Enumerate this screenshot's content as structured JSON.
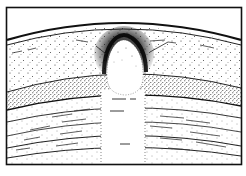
{
  "diagram": {
    "type": "geological-cross-section",
    "labels": [],
    "colors": {
      "background": "#ffffff",
      "ink": "#1a1a1a",
      "stipple": "#2a2a2a",
      "halo": "#111111"
    },
    "frame": {
      "x": 6,
      "y": 7,
      "width": 236,
      "height": 158
    },
    "layers": [
      {
        "name": "top-crust-band",
        "pattern": "solid-double-line"
      },
      {
        "name": "upper-sparse-stipple-layer",
        "pattern": "sparse-dots-with-dashes"
      },
      {
        "name": "dense-stipple-layer",
        "pattern": "dense-dots"
      },
      {
        "name": "lower-striated-layers",
        "pattern": "dots-with-horizontal-dashes"
      }
    ],
    "intrusion": {
      "shape": "dome-head-on-vertical-column",
      "halo": "dense-dark-stipple-around-dome-top"
    }
  }
}
